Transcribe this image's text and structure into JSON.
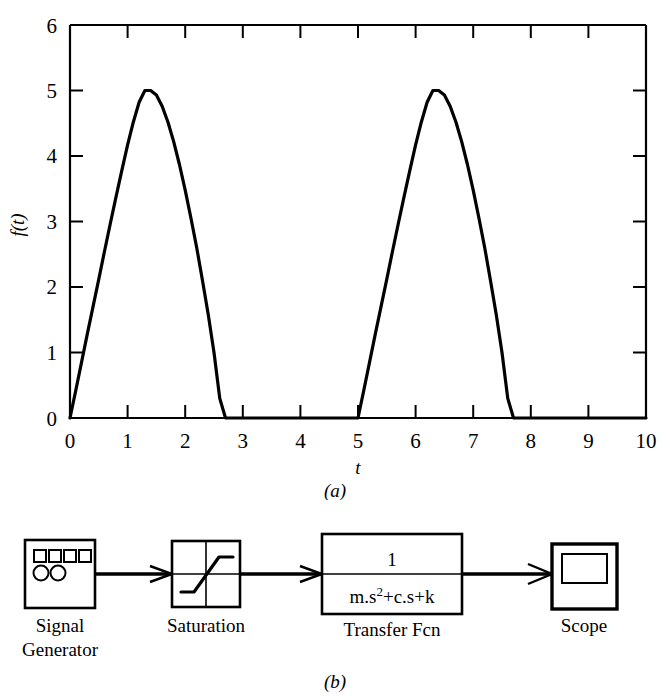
{
  "figure": {
    "panel_a_caption": "(a)",
    "panel_b_caption": "(b)"
  },
  "chart_data": {
    "type": "line",
    "title": "",
    "xlabel": "t",
    "ylabel": "f(t)",
    "xlim": [
      0,
      10
    ],
    "ylim": [
      0,
      6
    ],
    "xticks": [
      0,
      1,
      2,
      3,
      4,
      5,
      6,
      7,
      8,
      9,
      10
    ],
    "xticklabels": [
      "0",
      "1",
      "2",
      "3",
      "4",
      "5",
      "6",
      "7",
      "8",
      "9",
      "10"
    ],
    "yticks": [
      0,
      1,
      2,
      3,
      4,
      5,
      6
    ],
    "yticklabels": [
      "0",
      "1",
      "2",
      "3",
      "4",
      "5",
      "6"
    ],
    "grid": false,
    "legend": null,
    "line_color": "#000000",
    "line_width": 3.2,
    "series": [
      {
        "name": "f(t)",
        "x": [
          0.0,
          0.1,
          0.2,
          0.3,
          0.4,
          0.5,
          0.6,
          0.7,
          0.8,
          0.9,
          1.0,
          1.1,
          1.2,
          1.3,
          1.4,
          1.5,
          1.6,
          1.7,
          1.8,
          1.9,
          2.0,
          2.1,
          2.2,
          2.3,
          2.4,
          2.5,
          2.6,
          2.7,
          3.0,
          4.0,
          5.0,
          5.1,
          5.2,
          5.3,
          5.4,
          5.5,
          5.6,
          5.7,
          5.8,
          5.9,
          6.0,
          6.1,
          6.2,
          6.3,
          6.4,
          6.5,
          6.6,
          6.7,
          6.8,
          6.9,
          7.0,
          7.1,
          7.2,
          7.3,
          7.4,
          7.5,
          7.6,
          7.7,
          8.0,
          9.0,
          10.0
        ],
        "y": [
          0.0,
          0.42,
          0.85,
          1.28,
          1.7,
          2.12,
          2.55,
          2.97,
          3.38,
          3.78,
          4.17,
          4.52,
          4.82,
          5.0,
          5.0,
          4.93,
          4.76,
          4.52,
          4.22,
          3.87,
          3.48,
          3.05,
          2.6,
          2.1,
          1.58,
          1.0,
          0.3,
          0.0,
          0.0,
          0.0,
          0.0,
          0.42,
          0.85,
          1.28,
          1.7,
          2.12,
          2.55,
          2.97,
          3.38,
          3.78,
          4.17,
          4.52,
          4.82,
          5.0,
          5.0,
          4.93,
          4.76,
          4.52,
          4.22,
          3.87,
          3.48,
          3.05,
          2.6,
          2.1,
          1.58,
          1.0,
          0.3,
          0.0,
          0.0,
          0.0,
          0.0
        ]
      }
    ]
  },
  "diagram": {
    "blocks": [
      {
        "id": "signal-generator",
        "label_line1": "Signal",
        "label_line2": "Generator",
        "icon": "signal-generator-icon"
      },
      {
        "id": "saturation",
        "label_line1": "Saturation",
        "label_line2": "",
        "icon": "saturation-curve-icon"
      },
      {
        "id": "transfer-fcn",
        "label_line1": "Transfer Fcn",
        "label_line2": "",
        "numerator": "1",
        "denominator_base": "m.s",
        "denominator_sup": "2",
        "denominator_rest": "+c.s+k"
      },
      {
        "id": "scope",
        "label_line1": "Scope",
        "label_line2": "",
        "icon": "scope-icon"
      }
    ],
    "connectors": [
      {
        "from": "signal-generator",
        "to": "saturation"
      },
      {
        "from": "saturation",
        "to": "transfer-fcn"
      },
      {
        "from": "transfer-fcn",
        "to": "scope"
      }
    ]
  }
}
